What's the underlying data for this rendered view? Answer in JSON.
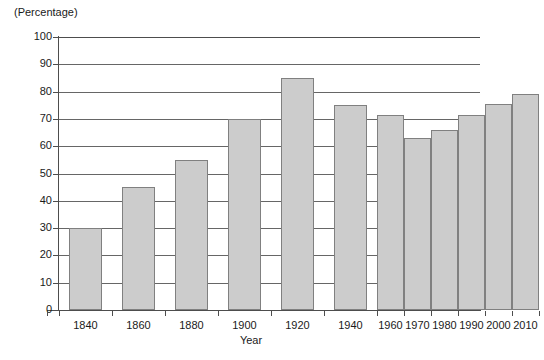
{
  "chart_data": {
    "type": "bar",
    "title": "",
    "ylabel": "(Percentage)",
    "xlabel": "Year",
    "categories": [
      "1840",
      "1860",
      "1880",
      "1900",
      "1920",
      "1940",
      "1960",
      "1970",
      "1980",
      "1990",
      "2000",
      "2010"
    ],
    "values": [
      30,
      45,
      55,
      70,
      85,
      75,
      71.5,
      63,
      66,
      71.5,
      75.5,
      79
    ],
    "ylim": [
      0,
      100
    ],
    "ytick_labels": [
      "100",
      "90",
      "80",
      "70",
      "60",
      "50",
      "40",
      "30",
      "20",
      "10",
      "0"
    ],
    "ytick_values": [
      100,
      90,
      80,
      70,
      60,
      50,
      40,
      30,
      20,
      10,
      0
    ],
    "grid": true,
    "grid_axis": "y",
    "legend": "none",
    "bar_fill_color": "#cccccc",
    "bar_border_color": "#808080",
    "axis_color": "#4d4d4d",
    "grid_color": "#666666",
    "note": "x-axis spacing is irregular: 1840-1940 at 20-year intervals with wide bars, 1960-2010 at 10-year intervals with narrow adjacent bars"
  },
  "bar_geometry": [
    {
      "label": "1840",
      "value": 30,
      "left": 10,
      "width": 33,
      "tick_left": 0,
      "tick_right": 53
    },
    {
      "label": "1860",
      "value": 45,
      "left": 63,
      "width": 33,
      "tick_left": 53,
      "tick_right": 106
    },
    {
      "label": "1880",
      "value": 55,
      "left": 116,
      "width": 33,
      "tick_left": 106,
      "tick_right": 159
    },
    {
      "label": "1900",
      "value": 70,
      "left": 169,
      "width": 33,
      "tick_left": 159,
      "tick_right": 212
    },
    {
      "label": "1920",
      "value": 85,
      "left": 222,
      "width": 33,
      "tick_left": 212,
      "tick_right": 265
    },
    {
      "label": "1940",
      "value": 75,
      "left": 275,
      "width": 33,
      "tick_left": 265,
      "tick_right": 318
    },
    {
      "label": "1960",
      "value": 71.5,
      "left": 318,
      "width": 27,
      "tick_left": 318,
      "tick_right": 345
    },
    {
      "label": "1970",
      "value": 63,
      "left": 345,
      "width": 27,
      "tick_left": 345,
      "tick_right": 372
    },
    {
      "label": "1980",
      "value": 66,
      "left": 372,
      "width": 27,
      "tick_left": 372,
      "tick_right": 399
    },
    {
      "label": "1990",
      "value": 71.5,
      "left": 399,
      "width": 27,
      "tick_left": 399,
      "tick_right": 426
    },
    {
      "label": "2000",
      "value": 75.5,
      "left": 426,
      "width": 27,
      "tick_left": 426,
      "tick_right": 453
    },
    {
      "label": "2010",
      "value": 79,
      "left": 453,
      "width": 27,
      "tick_left": 453,
      "tick_right": 480
    }
  ]
}
